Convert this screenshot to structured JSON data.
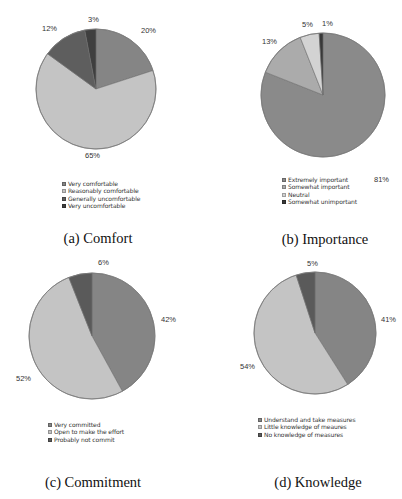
{
  "chart_data": [
    {
      "type": "pie",
      "title": "(a) Comfort",
      "categories": [
        "Very comfortable",
        "Reasonably comfortable",
        "Generally uncomfortable",
        "Very uncomfortable"
      ],
      "values": [
        20,
        65,
        12,
        3
      ],
      "value_labels": [
        "20%",
        "65%",
        "12%",
        "3%"
      ],
      "colors": [
        "#858585",
        "#c4c4c4",
        "#5e5e5e",
        "#3f3f3f"
      ],
      "start_angle": "12 o'clock, clockwise",
      "legend_position": "bottom"
    },
    {
      "type": "pie",
      "title": "(b) Importance",
      "categories": [
        "Extremely important",
        "Somewhat important",
        "Neutral",
        "Somewhat unimportant"
      ],
      "values": [
        81,
        13,
        5,
        1
      ],
      "value_labels": [
        "81%",
        "13%",
        "5%",
        "1%"
      ],
      "colors": [
        "#8a8a8a",
        "#ababab",
        "#d3d3d3",
        "#383838"
      ],
      "start_angle": "12 o'clock, clockwise",
      "legend_position": "bottom"
    },
    {
      "type": "pie",
      "title": "(c) Commitment",
      "categories": [
        "Very committed",
        "Open to make the effort",
        "Probably not commit"
      ],
      "values": [
        42,
        52,
        6
      ],
      "value_labels": [
        "42%",
        "52%",
        "6%"
      ],
      "colors": [
        "#858585",
        "#c4c4c4",
        "#5a5a5a"
      ],
      "start_angle": "12 o'clock, clockwise",
      "legend_position": "bottom"
    },
    {
      "type": "pie",
      "title": "(d) Knowledge",
      "categories": [
        "Understand and take measures",
        "Little knowledge of meaures",
        "No knowledge of measures"
      ],
      "values": [
        41,
        54,
        5
      ],
      "value_labels": [
        "41%",
        "54%",
        "5%"
      ],
      "colors": [
        "#858585",
        "#c4c4c4",
        "#5a5a5a"
      ],
      "start_angle": "12 o'clock, clockwise",
      "legend_position": "bottom"
    }
  ],
  "layout": [
    {
      "cx": 96,
      "cy": 89,
      "r": 60,
      "labels": [
        [
          141,
          33
        ],
        [
          85,
          158
        ],
        [
          42,
          31
        ],
        [
          88,
          22
        ]
      ],
      "legend": [
        62,
        180
      ],
      "caption": [
        98,
        240
      ]
    },
    {
      "cx": 323,
      "cy": 95,
      "r": 62,
      "labels": [
        [
          374,
          182
        ],
        [
          262,
          44
        ],
        [
          302,
          27
        ],
        [
          322,
          26
        ]
      ],
      "legend": [
        282,
        176
      ],
      "caption": [
        325,
        241
      ]
    },
    {
      "cx": 92,
      "cy": 336,
      "r": 63,
      "labels": [
        [
          161,
          322
        ],
        [
          16,
          381
        ],
        [
          98,
          265
        ],
        [
          0,
          0
        ]
      ],
      "legend": [
        48,
        421
      ],
      "caption": [
        93,
        484
      ]
    },
    {
      "cx": 315,
      "cy": 333,
      "r": 61,
      "labels": [
        [
          381,
          322
        ],
        [
          240,
          369
        ],
        [
          307,
          266
        ],
        [
          0,
          0
        ]
      ],
      "legend": [
        258,
        416
      ],
      "caption": [
        318,
        484
      ]
    }
  ]
}
